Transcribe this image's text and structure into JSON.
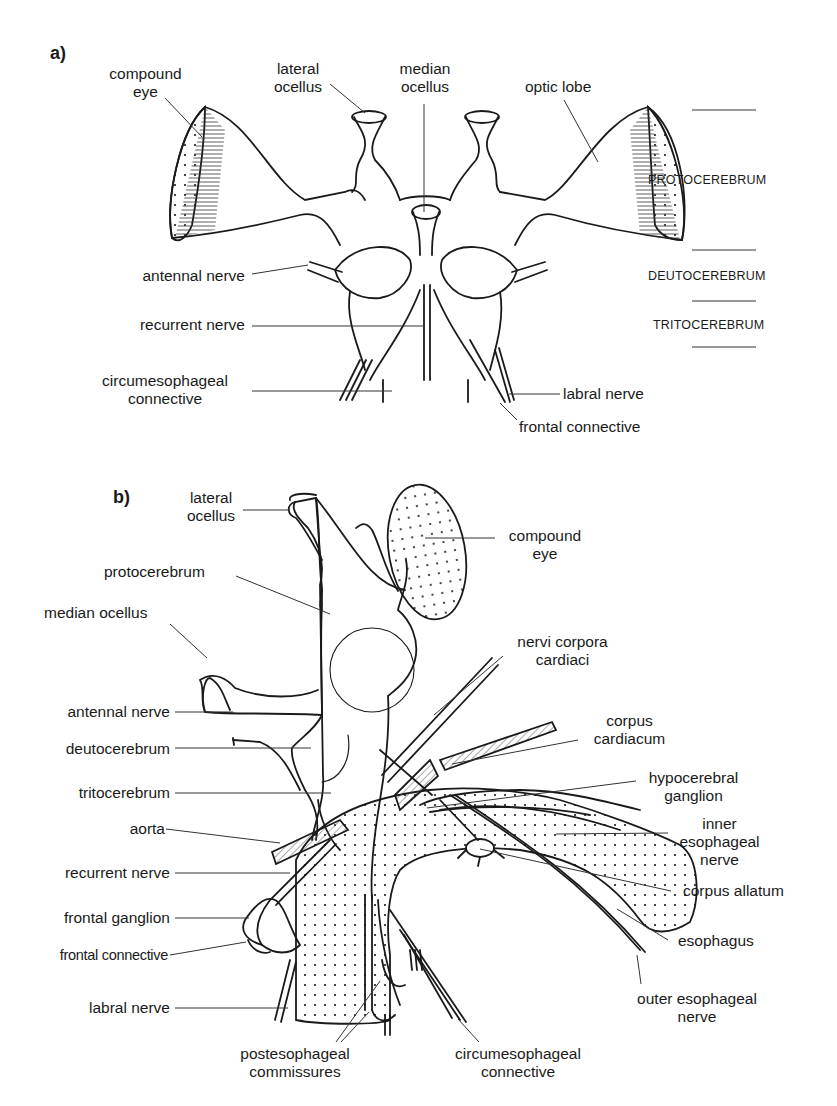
{
  "figure": {
    "panel_a": {
      "panel_label": "a)",
      "labels": {
        "compound_eye": [
          "compound",
          "eye"
        ],
        "lateral_ocellus": [
          "lateral",
          "ocellus"
        ],
        "median_ocellus": [
          "median",
          "ocellus"
        ],
        "optic_lobe": "optic lobe",
        "antennal_nerve": "antennal nerve",
        "recurrent_nerve": "recurrent nerve",
        "circumesophageal_connective": [
          "circumesophageal",
          "connective"
        ],
        "labral_nerve": "labral nerve",
        "frontal_connective": "frontal connective"
      },
      "regions": [
        "PROTOCEREBRUM",
        "DEUTOCEREBRUM",
        "TRITOCEREBRUM"
      ]
    },
    "panel_b": {
      "panel_label": "b)",
      "labels": {
        "lateral_ocellus": [
          "lateral",
          "ocellus"
        ],
        "compound_eye": [
          "compound",
          "eye"
        ],
        "protocerebrum": "protocerebrum",
        "median_ocellus": "median ocellus",
        "nervi_corpora_cardiaci": [
          "nervi corpora",
          "cardiaci"
        ],
        "antennal_nerve": "antennal nerve",
        "corpus_cardiacum": [
          "corpus",
          "cardiacum"
        ],
        "deutocerebrum": "deutocerebrum",
        "hypocerebral_ganglion": [
          "hypocerebral",
          "ganglion"
        ],
        "tritocerebrum": "tritocerebrum",
        "aorta": "aorta",
        "inner_esophageal_nerve": [
          "inner",
          "esophageal",
          "nerve"
        ],
        "recurrent_nerve": "recurrent nerve",
        "corpus_allatum": "corpus allatum",
        "frontal_ganglion": "frontal ganglion",
        "esophagus": "esophagus",
        "frontal_connective": "frontal connective",
        "labral_nerve": "labral nerve",
        "outer_esophageal_nerve": [
          "outer esophageal",
          "nerve"
        ],
        "postesophageal_commissures": [
          "postesophageal",
          "commissures"
        ],
        "circumesophageal_connective": [
          "circumesophageal",
          "connective"
        ]
      }
    },
    "colors": {
      "ink": "#1a1a1a",
      "leader": "#333333",
      "background": "#ffffff"
    }
  }
}
